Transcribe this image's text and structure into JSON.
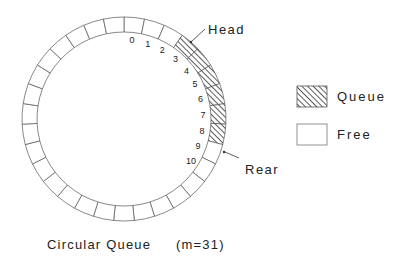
{
  "diagram": {
    "type": "circular-queue",
    "slot_count": 31,
    "center": [
      124,
      119
    ],
    "outer_radius": 102,
    "inner_radius": 87,
    "stroke_color": "#555555",
    "hatch_color": "#333333",
    "queue_slots": [
      3,
      4,
      5,
      6,
      7,
      8
    ],
    "numbered_slots": [
      "0",
      "1",
      "2",
      "3",
      "4",
      "5",
      "6",
      "7",
      "8",
      "9",
      "10"
    ],
    "head": {
      "label": "Head",
      "slot": 3
    },
    "rear": {
      "label": "Rear",
      "slot": 10
    }
  },
  "legend": {
    "items": [
      {
        "label": "Queue",
        "pattern": "hatched"
      },
      {
        "label": "Free",
        "pattern": "empty"
      }
    ]
  },
  "caption": {
    "title": "Circular Queue",
    "param": "(m=31)"
  }
}
